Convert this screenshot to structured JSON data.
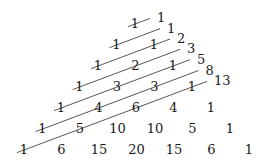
{
  "triangle_rows": [
    [
      "1"
    ],
    [
      "1",
      "1"
    ],
    [
      "1",
      "2",
      "1"
    ],
    [
      "1",
      "3",
      "3",
      "1"
    ],
    [
      "1",
      "4",
      "6",
      "4",
      "1"
    ],
    [
      "1",
      "5",
      "10",
      "10",
      "5",
      "1"
    ],
    [
      "1",
      "6",
      "15",
      "20",
      "15",
      "6",
      "1"
    ]
  ],
  "diagonal_sums": [
    "1",
    "1",
    "2",
    "3",
    "5",
    "8",
    "13"
  ],
  "colors": {
    "text": "#1a1a1a",
    "line": "#444444",
    "background": "#ffffff"
  }
}
